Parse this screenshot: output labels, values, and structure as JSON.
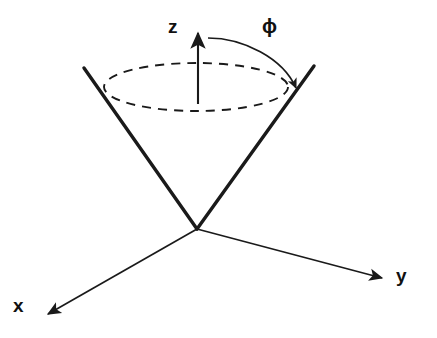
{
  "figure": {
    "background_color": "#ffffff",
    "stroke_color": "#1a1a1a",
    "width": 437,
    "height": 338
  },
  "labels": {
    "z_axis": "z",
    "y_axis": "y",
    "x_axis": "x",
    "azimuthal_angle": "ϕ"
  },
  "icons": {
    "z_arrow": "arrow-up-icon",
    "y_arrow": "arrow-right-icon",
    "x_arrow": "arrow-down-left-icon",
    "phi_arrow": "curved-arrow-icon"
  },
  "geometry": {
    "origin": {
      "x": 197,
      "y": 229
    },
    "z_axis": {
      "x1": 198,
      "y1": 104,
      "x2": 198,
      "y2": 30
    },
    "y_axis": {
      "x1": 197,
      "y1": 229,
      "x2": 386,
      "y2": 279
    },
    "x_axis": {
      "x1": 197,
      "y1": 229,
      "x2": 44,
      "y2": 316
    },
    "cone_left_edge": {
      "x1": 197,
      "y1": 229,
      "x2": 84,
      "y2": 68
    },
    "cone_right_edge": {
      "x1": 197,
      "y1": 229,
      "x2": 314,
      "y2": 66
    },
    "dashed_ellipse": {
      "cx": 196,
      "cy": 87,
      "rx": 92,
      "ry": 24
    },
    "phi_arc": {
      "start_x": 208,
      "start_y": 38,
      "end_x": 297,
      "end_y": 91
    }
  },
  "style": {
    "cone_edge_width": 3.4,
    "axis_width": 1.6,
    "ellipse_dash": "9 7",
    "ellipse_width": 1.8
  }
}
